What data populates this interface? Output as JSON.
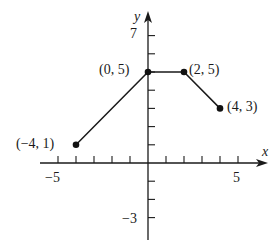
{
  "chart_data": {
    "type": "line",
    "title": "",
    "xlabel": "x",
    "ylabel": "y",
    "xlim": [
      -5,
      5
    ],
    "ylim": [
      -3,
      7
    ],
    "grid": false,
    "x_ticks": [
      -5,
      -4,
      -3,
      -2,
      -1,
      1,
      2,
      3,
      4,
      5
    ],
    "y_ticks": [
      -3,
      -2,
      -1,
      1,
      2,
      3,
      4,
      5,
      6,
      7
    ],
    "x_tick_labels": [
      {
        "value": -5,
        "label": "−5"
      },
      {
        "value": 5,
        "label": "5"
      }
    ],
    "y_tick_labels": [
      {
        "value": 7,
        "label": "7"
      },
      {
        "value": -3,
        "label": "−3"
      }
    ],
    "series": [
      {
        "name": "piecewise",
        "x": [
          -4,
          0,
          2,
          4
        ],
        "y": [
          1,
          5,
          5,
          3
        ]
      }
    ],
    "annotations": [
      {
        "x": -4,
        "y": 1,
        "text": "(−4, 1)"
      },
      {
        "x": 0,
        "y": 5,
        "text": "(0, 5)"
      },
      {
        "x": 2,
        "y": 5,
        "text": "(2, 5)"
      },
      {
        "x": 4,
        "y": 3,
        "text": "(4, 3)"
      }
    ]
  },
  "layout": {
    "origin_px": [
      148,
      163
    ],
    "unit_x_px": 18,
    "unit_y_px": 18.2,
    "colors": {
      "ink": "#1a1a1a",
      "background": "#ffffff"
    }
  }
}
